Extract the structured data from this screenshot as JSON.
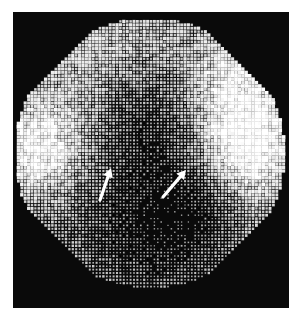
{
  "image": {
    "description": "Grayscale dot-matrix scintigraphic image in a circular field of view on black background with two white arrows pointing to regions of reduced activity",
    "background_color": "#ffffff",
    "frame_color": "#0a0a0a",
    "dot_color": "#ffffff"
  },
  "field": {
    "center": [
      150,
      153
    ],
    "radius": 135,
    "dot_pitch": 3.4
  },
  "arrows": [
    {
      "label": "arrow-left",
      "tail": [
        100,
        200
      ],
      "head": [
        111,
        168
      ]
    },
    {
      "label": "arrow-right",
      "tail": [
        163,
        197
      ],
      "head": [
        186,
        170
      ]
    }
  ]
}
